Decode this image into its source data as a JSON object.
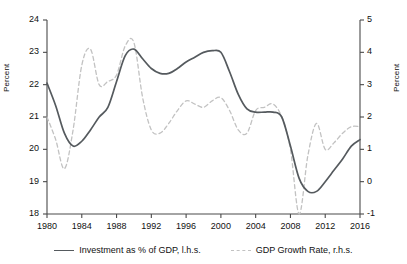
{
  "chart_data": {
    "type": "line",
    "title": "",
    "xlabel": "",
    "ylabel": "Percent",
    "ylabel_right": "Percent",
    "xlim": [
      1980,
      2016
    ],
    "ylim": [
      18,
      24
    ],
    "ylim_right": [
      -1,
      5
    ],
    "grid": false,
    "legend_position": "bottom-center",
    "x_ticks": [
      "1980",
      "1984",
      "1988",
      "1992",
      "1996",
      "2000",
      "2004",
      "2008",
      "2012",
      "2016"
    ],
    "y_ticks_left": [
      "18",
      "19",
      "20",
      "21",
      "22",
      "23",
      "24"
    ],
    "y_ticks_right": [
      "-1",
      "0",
      "1",
      "2",
      "3",
      "4",
      "5"
    ],
    "x": [
      1980,
      1981,
      1982,
      1983,
      1984,
      1985,
      1986,
      1987,
      1988,
      1989,
      1990,
      1991,
      1992,
      1993,
      1994,
      1995,
      1996,
      1997,
      1998,
      1999,
      2000,
      2001,
      2002,
      2003,
      2004,
      2005,
      2006,
      2007,
      2008,
      2009,
      2010,
      2011,
      2012,
      2013,
      2014,
      2015,
      2016
    ],
    "series": [
      {
        "name": "Investment as % of GDP, l.h.s.",
        "axis": "left",
        "style": "solid",
        "color": "#555a5e",
        "values": [
          22.05,
          21.35,
          20.5,
          20.1,
          20.25,
          20.6,
          21.0,
          21.3,
          22.1,
          22.9,
          23.1,
          22.8,
          22.5,
          22.35,
          22.35,
          22.5,
          22.7,
          22.85,
          23.0,
          23.05,
          23.0,
          22.4,
          21.7,
          21.25,
          21.15,
          21.15,
          21.15,
          21.0,
          20.1,
          19.1,
          18.7,
          18.7,
          19.0,
          19.35,
          19.7,
          20.1,
          20.3
        ]
      },
      {
        "name": "GDP Growth Rate, r.h.s.",
        "axis": "right",
        "style": "dashed",
        "color": "#c2c2c2",
        "values": [
          2.0,
          1.3,
          0.4,
          1.6,
          3.6,
          4.1,
          3.0,
          3.1,
          3.3,
          4.2,
          4.3,
          2.6,
          1.6,
          1.5,
          1.8,
          2.2,
          2.5,
          2.4,
          2.3,
          2.5,
          2.6,
          2.2,
          1.6,
          1.5,
          2.2,
          2.3,
          2.4,
          2.0,
          1.0,
          -1.0,
          0.8,
          1.8,
          1.0,
          1.2,
          1.5,
          1.7,
          1.7
        ]
      }
    ]
  },
  "legend": [
    {
      "label": "Investment as % of GDP, l.h.s.",
      "style": "solid"
    },
    {
      "label": "GDP Growth Rate, r.h.s.",
      "style": "dashed"
    }
  ]
}
